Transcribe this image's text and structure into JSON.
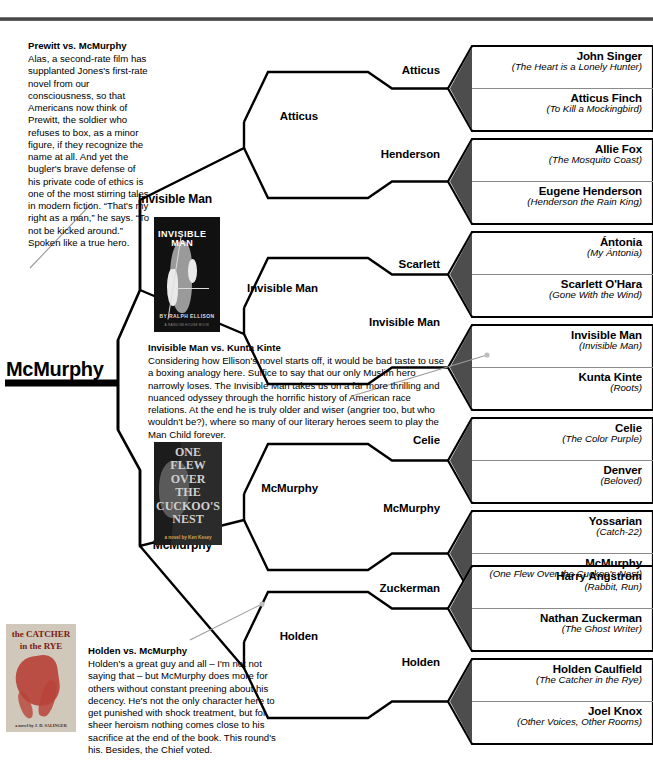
{
  "page": {
    "champion": "McMurphy",
    "rule_color": "#3a3a3a",
    "wedge_color": "#4d4d4d",
    "line_color": "#000000"
  },
  "round1": {
    "matchups": [
      {
        "winner": "Atticus",
        "entries": [
          {
            "name": "John Singer",
            "book": "(The Heart is a Lonely Hunter)"
          },
          {
            "name": "Atticus Finch",
            "book": "(To Kill a Mockingbird)"
          }
        ]
      },
      {
        "winner": "Henderson",
        "entries": [
          {
            "name": "Allie Fox",
            "book": "(The Mosquito Coast)"
          },
          {
            "name": "Eugene Henderson",
            "book": "(Henderson the Rain King)"
          }
        ]
      },
      {
        "winner": "Scarlett",
        "entries": [
          {
            "name": "Ántonia",
            "book": "(My Ántonia)"
          },
          {
            "name": "Scarlett O'Hara",
            "book": "(Gone With the Wind)"
          }
        ]
      },
      {
        "winner": "Invisible Man",
        "entries": [
          {
            "name": "Invisible Man",
            "book": "(Invisible Man)"
          },
          {
            "name": "Kunta Kinte",
            "book": "(Roots)"
          }
        ]
      },
      {
        "winner": "Celie",
        "entries": [
          {
            "name": "Celie",
            "book": "(The Color Purple)"
          },
          {
            "name": "Denver",
            "book": "(Beloved)"
          }
        ]
      },
      {
        "winner": "McMurphy",
        "entries": [
          {
            "name": "Yossarian",
            "book": "(Catch-22)"
          },
          {
            "name": "McMurphy",
            "book": "(One Flew Over the Cuckoo's Nest)"
          }
        ]
      },
      {
        "winner": "Zuckerman",
        "entries": [
          {
            "name": "Harry Angstrom",
            "book": "(Rabbit, Run)"
          },
          {
            "name": "Nathan Zuckerman",
            "book": "(The Ghost Writer)"
          }
        ]
      },
      {
        "winner": "Holden",
        "entries": [
          {
            "name": "Holden Caulfield",
            "book": "(The Catcher in the Rye)"
          },
          {
            "name": "Joel Knox",
            "book": "(Other Voices, Other Rooms)"
          }
        ]
      }
    ]
  },
  "round2": {
    "winners": [
      "Atticus",
      "Invisible Man",
      "McMurphy",
      "Holden"
    ]
  },
  "round3": {
    "winners": [
      "Invisible Man",
      "McMurphy"
    ]
  },
  "essays": [
    {
      "heading": "Prewitt vs. McMurphy",
      "body": "Alas, a second-rate film has supplanted Jones's first-rate novel from our consciousness, so that Americans now think of Prewitt, the soldier who refuses to box, as a minor figure, if they recognize the name at all. And yet the bugler's brave defense of his private code of ethics is one of the most stirring tales in modern fiction. “That's my right as a man,” he says. “To not be kicked around.” Spoken like a true hero."
    },
    {
      "heading": "Invisible Man vs. Kunta Kinte",
      "body": "Considering how Ellison's novel starts off, it would be bad taste to use a boxing analogy here. Suffice to say that our only Muslim hero narrowly loses. The Invisible Man takes us on a far more thrilling and nuanced odyssey through the horrific history of American race relations. At the end he is truly older and wiser (angrier too, but who wouldn't be?), where so many of our literary heroes seem to play the Man Child forever."
    },
    {
      "heading": "Holden vs. McMurphy",
      "body": "Holden's a great guy and all – I'm not not saying that – but McMurphy does more for others without constant preening about his decency. He's not the only character here to get punished with shock treatment, but for sheer heroism nothing comes close to his sacrifice at the end of the book. This round's his. Besides, the Chief voted."
    }
  ],
  "covers": [
    {
      "id": "invisible-man",
      "title_line1": "INVISIBLE",
      "title_line2": "MAN",
      "author": "BY RALPH ELLISON",
      "imprint": "A RANDOM HOUSE BOOK"
    },
    {
      "id": "cuckoos-nest",
      "lines": [
        "ONE",
        "FLEW",
        "OVER",
        "THE",
        "CUCKOO'S",
        "NEST"
      ],
      "author": "a novel by Ken Kesey"
    },
    {
      "id": "catcher-in-the-rye",
      "title_line1": "the CATCHER",
      "title_line2": "in the RYE",
      "author": "a novel by J. D. SALINGER"
    }
  ]
}
